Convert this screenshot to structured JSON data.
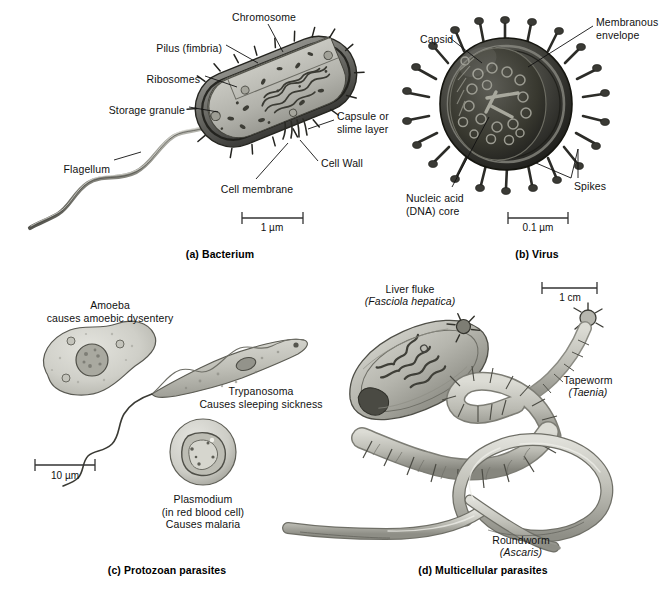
{
  "figure": {
    "background": "#ffffff",
    "ink": "#111111"
  },
  "panels": [
    {
      "id": "a",
      "caption": "(a) Bacterium",
      "caption_x": 220,
      "caption_y": 248,
      "scale_bar": {
        "label": "1 µm",
        "x1": 242,
        "x2": 303,
        "y": 218,
        "text_x": 272,
        "text_y": 222
      },
      "labels": [
        {
          "name": "chromosome",
          "text": "Chromosome",
          "x": 264,
          "y": 11,
          "align": "c",
          "italic": false
        },
        {
          "name": "pilus",
          "text": "Pilus (fimbria)",
          "x": 222,
          "y": 42,
          "align": "r",
          "italic": false
        },
        {
          "name": "ribosomes",
          "text": "Ribosomes",
          "x": 200,
          "y": 73,
          "align": "r",
          "italic": false
        },
        {
          "name": "storage-granule",
          "text": "Storage granule",
          "x": 185,
          "y": 104,
          "align": "r",
          "italic": false
        },
        {
          "name": "flagellum",
          "text": "Flagellum",
          "x": 110,
          "y": 163,
          "align": "r",
          "italic": false
        },
        {
          "name": "cell-membrane",
          "text": "Cell membrane",
          "x": 257,
          "y": 183,
          "align": "c",
          "italic": false
        },
        {
          "name": "cell-wall",
          "text": "Cell Wall",
          "x": 321,
          "y": 163,
          "align": "l",
          "italic": false
        },
        {
          "name": "capsule",
          "text": "Capsule or\nslime layer",
          "x": 337,
          "y": 116,
          "align": "l",
          "italic": false
        }
      ]
    },
    {
      "id": "b",
      "caption": "(b) Virus",
      "caption_x": 537,
      "caption_y": 248,
      "scale_bar": {
        "label": "0.1 µm",
        "x1": 508,
        "x2": 568,
        "y": 218,
        "text_x": 538,
        "text_y": 222
      },
      "labels": [
        {
          "name": "capsid",
          "text": "Capsid",
          "x": 420,
          "y": 33,
          "align": "l",
          "italic": false
        },
        {
          "name": "membranous-envelope",
          "text": "Membranous\nenvelope",
          "x": 596,
          "y": 16,
          "align": "l",
          "italic": false
        },
        {
          "name": "nucleic-acid-core",
          "text": "Nucleic acid\n(DNA) core",
          "x": 406,
          "y": 192,
          "align": "l",
          "italic": false
        },
        {
          "name": "spikes",
          "text": "Spikes",
          "x": 574,
          "y": 180,
          "align": "l",
          "italic": false
        }
      ]
    },
    {
      "id": "c",
      "caption": "(c) Protozoan parasites",
      "caption_x": 167,
      "caption_y": 564,
      "scale_bar": {
        "label": "10 µm",
        "x1": 35,
        "x2": 95,
        "y": 465,
        "text_x": 65,
        "text_y": 470
      },
      "labels": [
        {
          "name": "amoeba",
          "text": "Amoeba\ncauses amoebic dysentery",
          "x": 110,
          "y": 299,
          "align": "c",
          "italic": false
        },
        {
          "name": "trypanosoma",
          "text": "Trypanosoma\nCauses sleeping sickness",
          "x": 261,
          "y": 385,
          "align": "c",
          "italic": false
        },
        {
          "name": "plasmodium",
          "text": "Plasmodium\n(in red blood cell)\nCauses malaria",
          "x": 203,
          "y": 493,
          "align": "c",
          "italic": false
        }
      ]
    },
    {
      "id": "d",
      "caption": "(d) Multicellular parasites",
      "caption_x": 483,
      "caption_y": 564,
      "scale_bar": {
        "label": "1 cm",
        "x1": 542,
        "x2": 597,
        "y": 288,
        "text_x": 570,
        "text_y": 292
      },
      "labels": [
        {
          "name": "liver-fluke-common",
          "text": "Liver fluke",
          "x": 410,
          "y": 283,
          "align": "c",
          "italic": false
        },
        {
          "name": "liver-fluke-species",
          "text": "(Fasciola hepatica)",
          "x": 410,
          "y": 295,
          "align": "c",
          "italic": true
        },
        {
          "name": "tapeworm-common",
          "text": "Tapeworm",
          "x": 588,
          "y": 374,
          "align": "c",
          "italic": false
        },
        {
          "name": "tapeworm-species",
          "text": "(Taenia)",
          "x": 588,
          "y": 386,
          "align": "c",
          "italic": true
        },
        {
          "name": "roundworm-common",
          "text": "Roundworm",
          "x": 521,
          "y": 534,
          "align": "c",
          "italic": false
        },
        {
          "name": "roundworm-species",
          "text": "(Ascaris)",
          "x": 521,
          "y": 546,
          "align": "c",
          "italic": true
        }
      ]
    }
  ],
  "organisms": {
    "bacterium": {
      "name": "Bacterium",
      "structures": [
        "Chromosome",
        "Pilus (fimbria)",
        "Ribosomes",
        "Storage granule",
        "Flagellum",
        "Cell membrane",
        "Cell Wall",
        "Capsule or slime layer"
      ],
      "scale": "1 µm"
    },
    "virus": {
      "name": "Virus",
      "structures": [
        "Capsid",
        "Membranous envelope",
        "Nucleic acid (DNA) core",
        "Spikes"
      ],
      "scale": "0.1 µm"
    },
    "amoeba": {
      "name": "Amoeba",
      "disease": "causes amoebic dysentery"
    },
    "trypanosoma": {
      "name": "Trypanosoma",
      "disease": "Causes sleeping sickness"
    },
    "plasmodium": {
      "name": "Plasmodium",
      "location": "(in red blood cell)",
      "disease": "Causes malaria"
    },
    "liver_fluke": {
      "name": "Liver fluke",
      "species": "(Fasciola hepatica)"
    },
    "tapeworm": {
      "name": "Tapeworm",
      "species": "(Taenia)"
    },
    "roundworm": {
      "name": "Roundworm",
      "species": "(Ascaris)"
    }
  }
}
